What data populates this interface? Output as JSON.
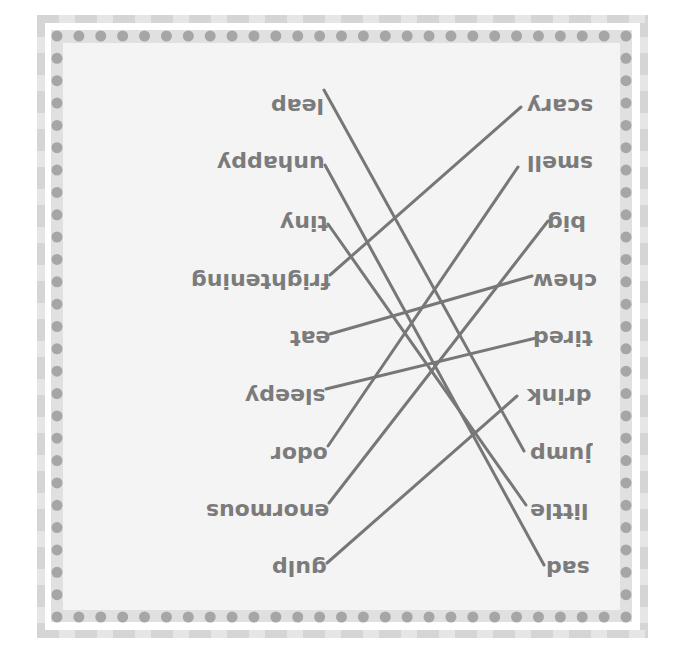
{
  "worksheet": {
    "orientation": "rotated-180",
    "colors": {
      "frame_dark": "#d5d5d5",
      "frame_light": "#e6e6e6",
      "band": "#e0e0e0",
      "dot": "#a6a6a6",
      "panel": "#f4f4f4",
      "text": "#7b7b7b",
      "line": "#777777"
    },
    "left_words": [
      {
        "label": "leap",
        "x": 324,
        "y": 95,
        "anchor_x": 324,
        "anchor_y": 90
      },
      {
        "label": "unhappy",
        "x": 325,
        "y": 152,
        "anchor_x": 325,
        "anchor_y": 165
      },
      {
        "label": "tiny",
        "x": 328,
        "y": 212,
        "anchor_x": 328,
        "anchor_y": 224
      },
      {
        "label": "frightening",
        "x": 330,
        "y": 270,
        "anchor_x": 330,
        "anchor_y": 275
      },
      {
        "label": "eat",
        "x": 330,
        "y": 327,
        "anchor_x": 330,
        "anchor_y": 334
      },
      {
        "label": "sleepy",
        "x": 326,
        "y": 385,
        "anchor_x": 326,
        "anchor_y": 389
      },
      {
        "label": "odor",
        "x": 328,
        "y": 443,
        "anchor_x": 328,
        "anchor_y": 446
      },
      {
        "label": "enormous",
        "x": 329,
        "y": 500,
        "anchor_x": 329,
        "anchor_y": 503
      },
      {
        "label": "gulp",
        "x": 327,
        "y": 557,
        "anchor_x": 327,
        "anchor_y": 563
      }
    ],
    "right_words": [
      {
        "label": "scary",
        "x": 527,
        "y": 95,
        "anchor_x": 521,
        "anchor_y": 107
      },
      {
        "label": "smell",
        "x": 527,
        "y": 152,
        "anchor_x": 518,
        "anchor_y": 167
      },
      {
        "label": "big",
        "x": 547,
        "y": 212,
        "anchor_x": 548,
        "anchor_y": 221
      },
      {
        "label": "chew",
        "x": 533,
        "y": 270,
        "anchor_x": 532,
        "anchor_y": 276
      },
      {
        "label": "tired",
        "x": 533,
        "y": 327,
        "anchor_x": 536,
        "anchor_y": 338
      },
      {
        "label": "drink",
        "x": 527,
        "y": 385,
        "anchor_x": 517,
        "anchor_y": 396
      },
      {
        "label": "jump",
        "x": 530,
        "y": 443,
        "anchor_x": 524,
        "anchor_y": 451
      },
      {
        "label": "little",
        "x": 530,
        "y": 500,
        "anchor_x": 526,
        "anchor_y": 505
      },
      {
        "label": "sad",
        "x": 546,
        "y": 557,
        "anchor_x": 544,
        "anchor_y": 565
      }
    ],
    "matches": [
      {
        "left": "leap",
        "right": "jump"
      },
      {
        "left": "unhappy",
        "right": "sad"
      },
      {
        "left": "tiny",
        "right": "little"
      },
      {
        "left": "frightening",
        "right": "scary"
      },
      {
        "left": "eat",
        "right": "chew"
      },
      {
        "left": "sleepy",
        "right": "tired"
      },
      {
        "left": "odor",
        "right": "smell"
      },
      {
        "left": "enormous",
        "right": "big"
      },
      {
        "left": "gulp",
        "right": "drink"
      }
    ],
    "dots": {
      "count_per_side": 27,
      "x_start": 57,
      "x_end": 626,
      "y_start": 36,
      "y_end": 617,
      "radius": 5.5
    }
  }
}
